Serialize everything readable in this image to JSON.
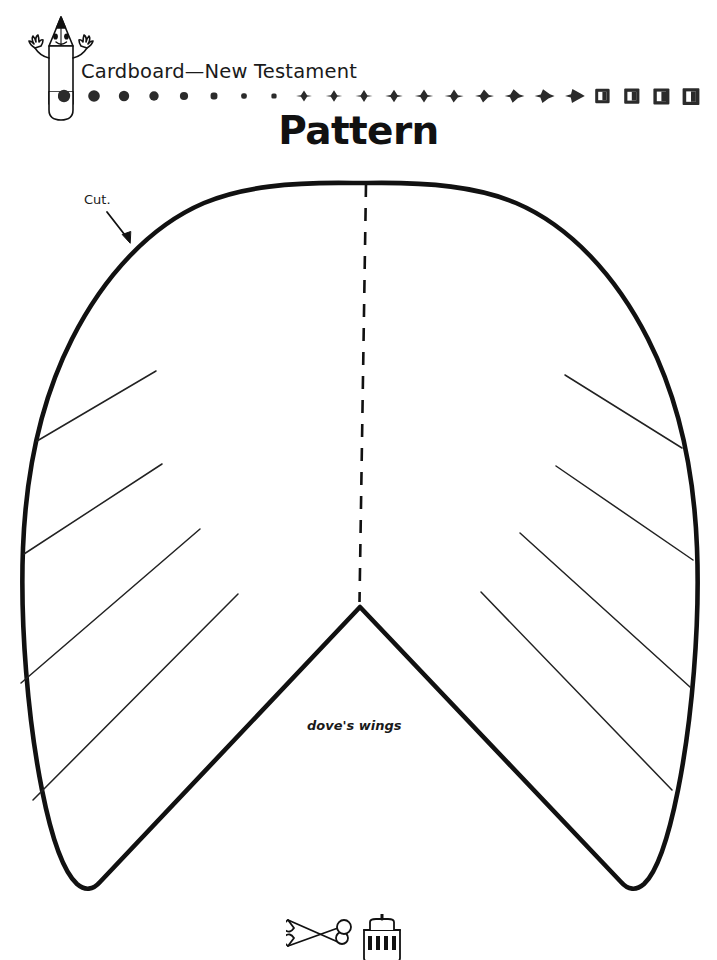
{
  "page": {
    "width": 717,
    "height": 960,
    "background": "#ffffff",
    "ink": "#111111"
  },
  "header": {
    "mascot_icon": "pencil-mascot-icon",
    "title": "Cardboard—New Testament",
    "page_title": "Pattern",
    "divider": {
      "icon": "gradient-dot-rule",
      "count": 22,
      "description": "row of marks morphing from large circles on the left through small diamonds to large squares on the right"
    }
  },
  "pattern": {
    "cut_label": "Cut.",
    "cut_arrow_icon": "arrow-down-right-icon",
    "part_label": "dove's wings",
    "fold_line_icon": "dashed-fold-line",
    "outline_icon": "dove-wings-outline",
    "feather_line_count": 8
  },
  "footer": {
    "art_icon": "scissors-and-glue-icon"
  }
}
